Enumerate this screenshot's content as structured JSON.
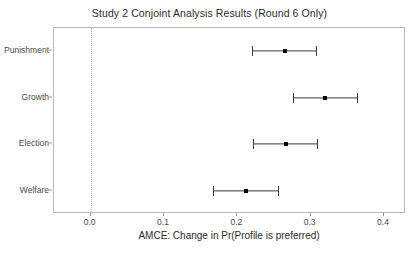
{
  "chart_data": {
    "type": "scatter",
    "title": "Study 2 Conjoint Analysis Results (Round 6 Only)",
    "xlabel": "AMCE: Change in Pr(Profile is preferred)",
    "ylabel": "",
    "orientation": "horizontal",
    "grid": false,
    "legend": "none",
    "xlim": [
      -0.05,
      0.43
    ],
    "xticks": [
      0.0,
      0.1,
      0.2,
      0.3,
      0.4
    ],
    "xticklabels": [
      "0.0",
      "0.1",
      "0.2",
      "0.3",
      "0.4"
    ],
    "categories": [
      "Punishment",
      "Growth",
      "Election",
      "Welfare"
    ],
    "values": [
      0.265,
      0.32,
      0.267,
      0.212
    ],
    "ci_low": [
      0.22,
      0.276,
      0.221,
      0.167
    ],
    "ci_high": [
      0.307,
      0.363,
      0.309,
      0.255
    ],
    "reference_line": 0.0,
    "reference_line_style": "dotted",
    "points": [
      {
        "category": "Punishment",
        "estimate": 0.265,
        "ci_low": 0.22,
        "ci_high": 0.307
      },
      {
        "category": "Growth",
        "estimate": 0.32,
        "ci_low": 0.276,
        "ci_high": 0.363
      },
      {
        "category": "Election",
        "estimate": 0.267,
        "ci_low": 0.221,
        "ci_high": 0.309
      },
      {
        "category": "Welfare",
        "estimate": 0.212,
        "ci_low": 0.167,
        "ci_high": 0.255
      }
    ],
    "colors": {
      "point": "#000000",
      "errorbar": "#3a3a3a",
      "reference_line": "#bdbdbd",
      "panel_border": "#b9b9b9",
      "text": "#2b2b2b",
      "background": "#ffffff"
    }
  }
}
